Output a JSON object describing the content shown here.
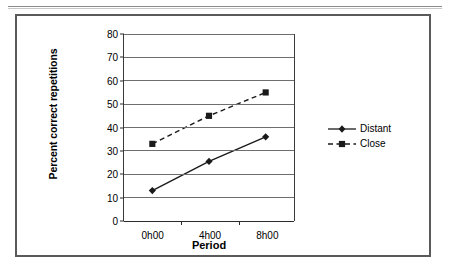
{
  "chart_data": {
    "type": "line",
    "title": "",
    "xlabel": "Period",
    "ylabel": "Percent correct repetitions",
    "categories": [
      "0h00",
      "4h00",
      "8h00"
    ],
    "ylim": [
      0,
      80
    ],
    "yticks": [
      0,
      10,
      20,
      30,
      40,
      50,
      60,
      70,
      80
    ],
    "ytick_labels": [
      "0",
      "10",
      "20",
      "30",
      "40",
      "50",
      "60",
      "70",
      "80"
    ],
    "grid": true,
    "legend_position": "right",
    "series": [
      {
        "name": "Distant",
        "values": [
          13,
          25.5,
          36
        ],
        "line_style": "solid",
        "marker": "diamond",
        "color": "#1a1a1a"
      },
      {
        "name": "Close",
        "values": [
          33,
          45,
          55
        ],
        "line_style": "dashed",
        "marker": "square",
        "color": "#1a1a1a"
      }
    ]
  },
  "legend": {
    "entries": [
      {
        "label": "Distant"
      },
      {
        "label": "Close"
      }
    ]
  },
  "colors": {
    "frame": "#5a5a5a",
    "gridline": "#6e6e6e",
    "axis": "#2b2b2b",
    "series": "#1a1a1a",
    "background": "#ffffff"
  }
}
